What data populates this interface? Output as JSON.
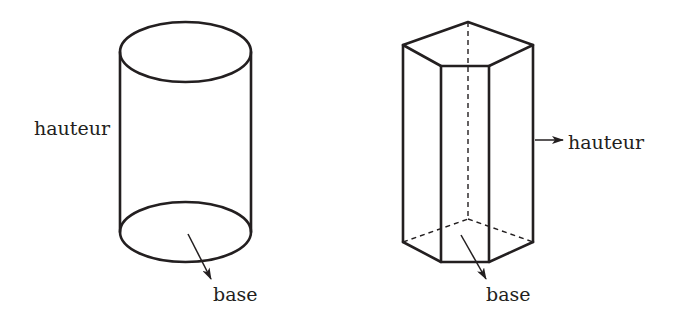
{
  "figures": {
    "cylinder": {
      "name": "cylindre",
      "labels": {
        "height": "hauteur",
        "base": "base"
      }
    },
    "prism": {
      "name": "prisme pentagonal",
      "labels": {
        "height": "hauteur",
        "base": "base"
      }
    }
  },
  "colors": {
    "stroke": "#231f20",
    "background": "#ffffff"
  }
}
